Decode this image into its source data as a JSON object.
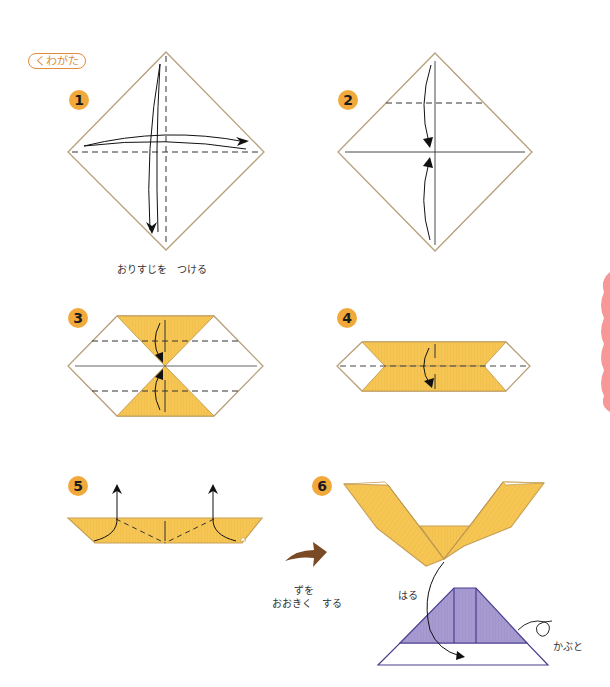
{
  "title": "くわがた",
  "colors": {
    "paper_edge": "#b8a07a",
    "yellow_fill": "#f6c654",
    "yellow_edge": "#c7a055",
    "purple_fill": "#a79ad1",
    "purple_edge": "#4a3f8f",
    "badge": "#f2a93b",
    "title_accent": "#e08c3c",
    "big_arrow": "#7a4a24",
    "side_tab": "#f79797"
  },
  "steps": [
    {
      "number": "1",
      "caption": "おりすじを　つける"
    },
    {
      "number": "2",
      "caption": ""
    },
    {
      "number": "3",
      "caption": ""
    },
    {
      "number": "4",
      "caption": ""
    },
    {
      "number": "5",
      "caption": ""
    },
    {
      "number": "6",
      "caption": ""
    }
  ],
  "transition": {
    "line1": "ずを",
    "line2": "おおきく　する"
  },
  "labels": {
    "paste": "はる",
    "helmet": "かぶと"
  }
}
